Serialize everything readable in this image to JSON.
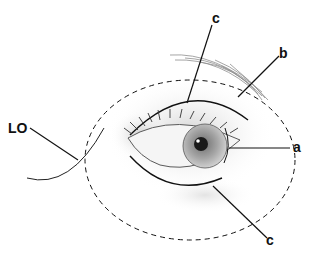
{
  "diagram": {
    "labels": {
      "lo": "LO",
      "a": "a",
      "b": "b",
      "c_top": "c",
      "c_bottom": "c"
    },
    "colors": {
      "line": "#111111",
      "shading": "#9a9a9a",
      "iris": "#8a8a8a",
      "pupil": "#1a1a1a",
      "background": "#ffffff"
    }
  }
}
